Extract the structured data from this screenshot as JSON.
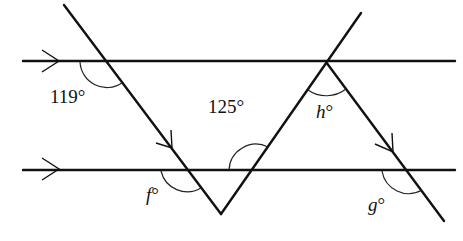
{
  "diagram": {
    "type": "geometry-parallel-lines-transversals",
    "parallel_lines": [
      {
        "name": "top-line",
        "arrow": "right-pointing"
      },
      {
        "name": "bottom-line",
        "arrow": "right-pointing"
      }
    ],
    "angle_labels": {
      "a119": "119°",
      "a125": "125°",
      "h": "h",
      "f": "f",
      "g": "g",
      "degree": "°"
    },
    "colors": {
      "stroke": "#111111",
      "background": "#ffffff"
    }
  }
}
